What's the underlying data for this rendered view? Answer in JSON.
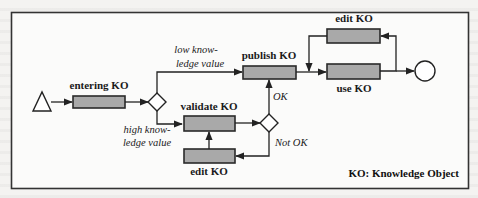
{
  "diagram": {
    "type": "process-flow",
    "legend": "KO: Knowledge Object",
    "nodes": {
      "start": {
        "shape": "triangle",
        "label": ""
      },
      "entering": {
        "shape": "box",
        "label": "entering KO"
      },
      "decision_value": {
        "shape": "diamond",
        "label": ""
      },
      "publish": {
        "shape": "box",
        "label": "publish KO"
      },
      "validate": {
        "shape": "box",
        "label": "validate KO"
      },
      "decision_ok": {
        "shape": "diamond",
        "label": ""
      },
      "edit_bottom": {
        "shape": "box",
        "label": "edit KO"
      },
      "edit_top": {
        "shape": "box",
        "label": "edit KO"
      },
      "use": {
        "shape": "box",
        "label": "use KO"
      },
      "end": {
        "shape": "circle",
        "label": ""
      }
    },
    "edge_labels": {
      "low_value_line1": "low know-",
      "low_value_line2": "ledge value",
      "high_value_line1": "high know-",
      "high_value_line2": "ledge value",
      "ok": "OK",
      "not_ok": "Not OK"
    },
    "edges": [
      {
        "from": "start",
        "to": "entering"
      },
      {
        "from": "entering",
        "to": "decision_value"
      },
      {
        "from": "decision_value",
        "to": "publish",
        "label": "low knowledge value"
      },
      {
        "from": "decision_value",
        "to": "validate",
        "label": "high knowledge value"
      },
      {
        "from": "validate",
        "to": "decision_ok"
      },
      {
        "from": "decision_ok",
        "to": "publish",
        "label": "OK"
      },
      {
        "from": "decision_ok",
        "to": "edit_bottom",
        "label": "Not OK"
      },
      {
        "from": "edit_bottom",
        "to": "validate"
      },
      {
        "from": "publish",
        "to": "use"
      },
      {
        "from": "use",
        "to": "edit_top"
      },
      {
        "from": "edit_top",
        "to": "use"
      },
      {
        "from": "use",
        "to": "end"
      }
    ]
  }
}
